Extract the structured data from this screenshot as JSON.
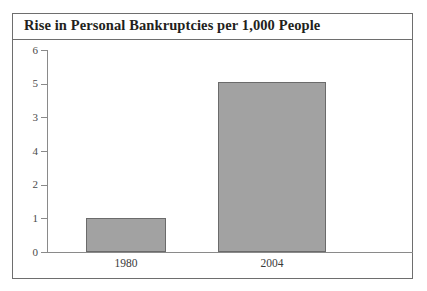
{
  "chart_data": {
    "type": "bar",
    "title": "Rise in Personal Bankruptcies per 1,000 People",
    "xlabel": "",
    "ylabel": "",
    "categories": [
      "1980",
      "2004"
    ],
    "values": [
      1.0,
      5.05
    ],
    "ylim": [
      0,
      6
    ],
    "y_tick_labels_top_to_bottom": [
      "6",
      "5",
      "3",
      "4",
      "2",
      "1",
      "0"
    ],
    "y_tick_values_top_to_bottom": [
      6,
      5,
      4,
      3,
      2,
      1,
      0
    ],
    "note_on_axis": "Printed tick labels read 6, 5, 3, 4, 2, 1, 0 top-to-bottom; the 3 and 4 are transposed in the source figure.",
    "grid": false,
    "legend": null,
    "bar_fill_color": "#a2a2a2",
    "bar_border_color": "#6b6b6b",
    "axis_color": "#8a8a8a",
    "frame_color": "#6e6e6e",
    "title_color": "#231f20"
  },
  "figure": {
    "title": "Rise in Personal Bankruptcies per 1,000 People"
  },
  "y_axis": {
    "ticks": [
      {
        "label": "6"
      },
      {
        "label": "5"
      },
      {
        "label": "3"
      },
      {
        "label": "4"
      },
      {
        "label": "2"
      },
      {
        "label": "1"
      },
      {
        "label": "0"
      }
    ]
  },
  "x_axis": {
    "labels": [
      {
        "label": "1980"
      },
      {
        "label": "2004"
      }
    ]
  },
  "bars": [
    {
      "category": "1980",
      "value": 1.0
    },
    {
      "category": "2004",
      "value": 5.05
    }
  ]
}
